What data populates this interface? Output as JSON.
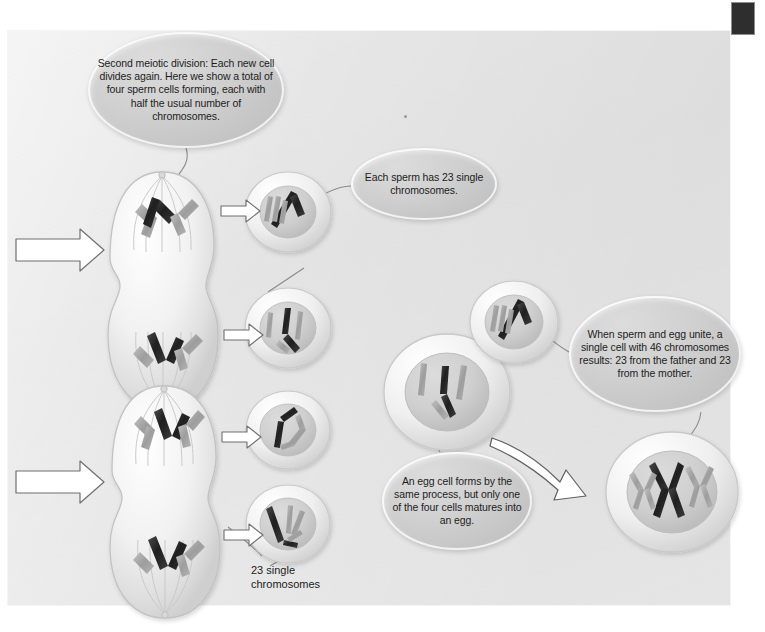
{
  "figure": {
    "type": "biology-process-diagram"
  },
  "callouts": [
    {
      "id": "second-meiotic-division",
      "text": "Second meiotic division: Each new cell divides again. Here we show a total of four sperm cells forming, each with half the usual number of chromosomes."
    },
    {
      "id": "each-sperm-23",
      "text": "Each sperm has 23 single chromosomes."
    },
    {
      "id": "when-sperm-and-egg-unite",
      "text": "When sperm and egg unite, a single cell with 46 chromosomes results: 23 from the father and 23 from the mother."
    },
    {
      "id": "an-egg-cell",
      "text": "An egg cell forms by the same process, but only one of the four cells matures into an egg."
    }
  ],
  "labels": [
    {
      "id": "twenty-three-single-chromosomes",
      "text": "23 single chromosomes"
    }
  ],
  "colors": {
    "page_background": "#ffffff",
    "panel_background": "#e7e7e7",
    "callout_fill": "#cfcfcf",
    "text": "#1d1d1d",
    "chromosome_dark": "#2b2b2b",
    "chromosome_light": "#a9a9a9",
    "cell_membrane": "#d6d6d6",
    "arrow_fill": "#ffffff",
    "arrow_stroke": "#6f6f6f",
    "scan_marker": "#2e2e2e"
  },
  "elements": {
    "dividing_cell_top": "dividing-cell-upper",
    "dividing_cell_bottom": "dividing-cell-lower",
    "sperm_cells_count": 4,
    "egg_cell": "mature-egg-cell",
    "fertilizing_sperm": "sperm-at-egg",
    "zygote": "fertilized-egg-46-chromosomes",
    "entry_arrows": 2,
    "split_arrows": 4,
    "fertilization_arrow": 1
  }
}
